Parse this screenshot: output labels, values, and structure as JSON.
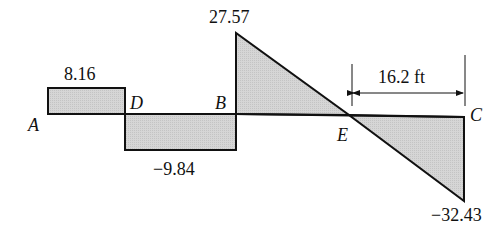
{
  "diagram": {
    "type": "shear force diagram",
    "points": {
      "A": "A",
      "D": "D",
      "B": "B",
      "E": "E",
      "C": "C"
    },
    "values": {
      "AD": "8.16",
      "DB": "−9.84",
      "B_peak": "27.57",
      "C_end": "−32.43"
    },
    "dimension": {
      "EC": "16.2 ft"
    },
    "colors": {
      "fill": "#d4d4d4",
      "stroke": "#111111"
    }
  }
}
